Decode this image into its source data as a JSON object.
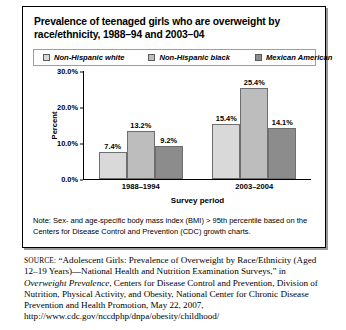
{
  "figure": {
    "title": "Prevalence of teenaged girls who are overweight by race/ethnicity, 1988–94 and 2003–04",
    "note": "Note: Sex- and age-specific body mass index (BMI) > 95th percentile based on the Centers for Disease Control and Prevention (CDC) growth charts."
  },
  "source": {
    "label": "SOURCE:",
    "text_part1": "“Adolescent Girls: Prevalence of Overweight by Race/Ethnicity (Aged 12–19 Years)—National Health and Nutrition Examination Surveys,” in ",
    "italic_title": "Overweight Prevalence",
    "text_part2": ", Centers for Disease Control and Prevention, Division of Nutrition, Physical Activity, and Obesity, National Center for Chronic Disease Prevention and Health Promotion, May 22, 2007, http://www.cdc.gov/nccdphp/dnpa/obesity/childhood/"
  },
  "chart_data": {
    "type": "bar",
    "title": "Prevalence of teenaged girls who are overweight by race/ethnicity, 1988–94 and 2003–04",
    "xlabel": "Survey period",
    "ylabel": "Percent",
    "categories": [
      "1988–1994",
      "2003–2004"
    ],
    "series": [
      {
        "name": "Non-Hispanic white",
        "color": "#d9d9d9",
        "values": [
          7.4,
          15.4
        ],
        "labels": [
          "7.4%",
          "15.4%"
        ]
      },
      {
        "name": "Non-Hispanic black",
        "color": "#bdbdbd",
        "values": [
          13.2,
          25.4
        ],
        "labels": [
          "13.2%",
          "25.4%"
        ]
      },
      {
        "name": "Mexican American",
        "color": "#8c8c8c",
        "values": [
          9.2,
          14.1
        ],
        "labels": [
          "9.2%",
          "14.1%"
        ]
      }
    ],
    "ylim": [
      0,
      30
    ],
    "yticks": [
      30.0,
      20.0,
      10.0,
      0.0
    ],
    "yticklabels": [
      "30.0%",
      "20.0%",
      "10.0%",
      "0.0%"
    ],
    "grid": false,
    "legend_position": "top"
  }
}
